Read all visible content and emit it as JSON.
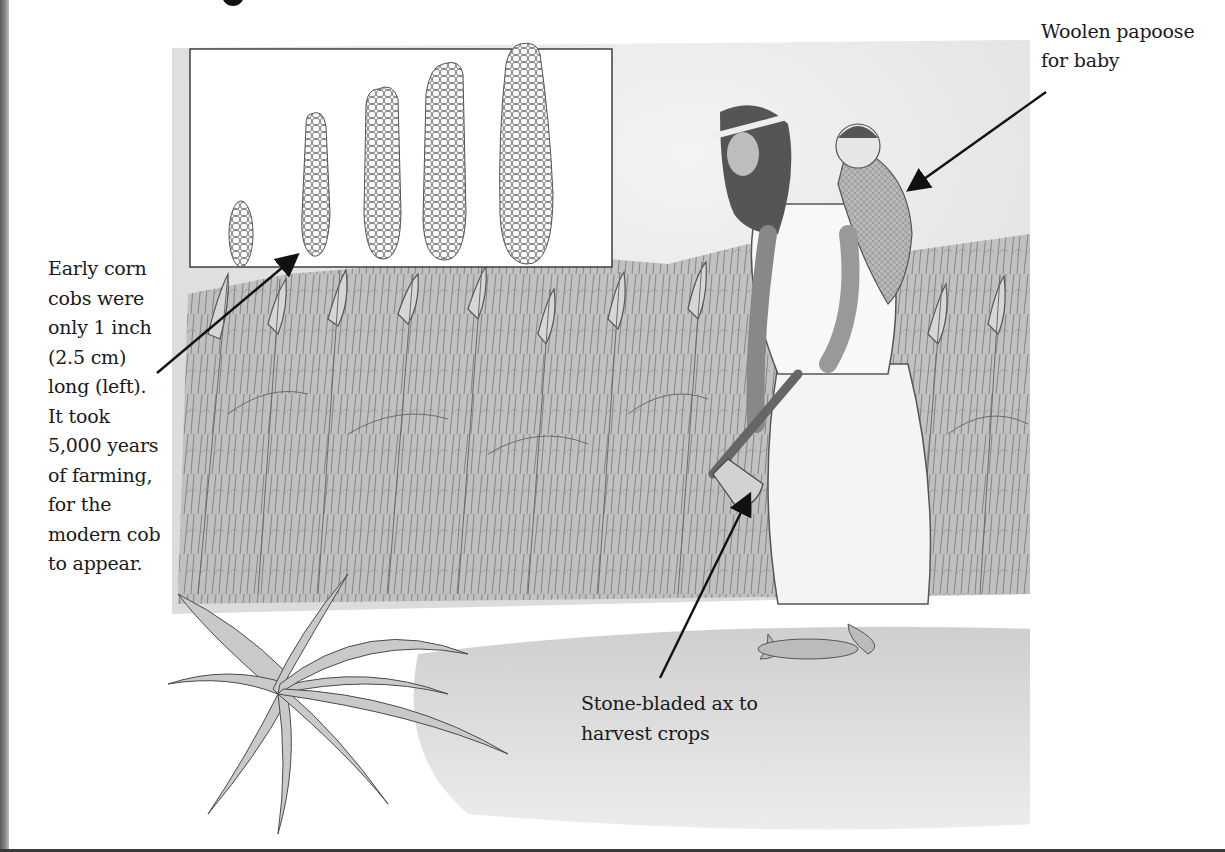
{
  "page": {
    "heading_fragment": "g",
    "illustration": {
      "subject": "Woman carrying baby in papoose harvesting corn with stone-bladed ax",
      "inset": {
        "description": "Evolution of corn cobs from smallest (left) to modern (right)",
        "cob_count": 5
      }
    },
    "captions": {
      "corn": {
        "lines": [
          "Early corn",
          "cobs were",
          "only 1 inch",
          "(2.5 cm)",
          "long (left).",
          "It took",
          "5,000 years",
          "of farming,",
          "for the",
          "modern cob",
          "to appear."
        ]
      },
      "papoose": {
        "lines": [
          "Woolen papoose",
          "for baby"
        ]
      },
      "ax": {
        "lines": [
          "Stone-bladed ax to",
          "harvest crops"
        ]
      }
    },
    "colors": {
      "ink": "#1a1a1a",
      "paper": "#ffffff",
      "sky": "#e9e9e9",
      "ground": "#d9d9d9"
    }
  }
}
